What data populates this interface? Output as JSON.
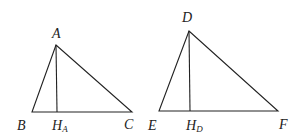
{
  "diagram": {
    "triangle1": {
      "vertices": {
        "A": [
          56,
          45
        ],
        "B": [
          32,
          112
        ],
        "C": [
          132,
          112
        ]
      },
      "foot": {
        "H_A": [
          57,
          112
        ]
      },
      "labels": {
        "A": "A",
        "B": "B",
        "C": "C",
        "H": "H",
        "H_sub": "A"
      }
    },
    "triangle2": {
      "vertices": {
        "D": [
          189,
          31
        ],
        "E": [
          159,
          111
        ],
        "F": [
          278,
          111
        ]
      },
      "foot": {
        "H_D": [
          190,
          111
        ]
      },
      "labels": {
        "D": "D",
        "E": "E",
        "F": "F",
        "H": "H",
        "H_sub": "D"
      }
    },
    "stroke_color": "#222222"
  }
}
